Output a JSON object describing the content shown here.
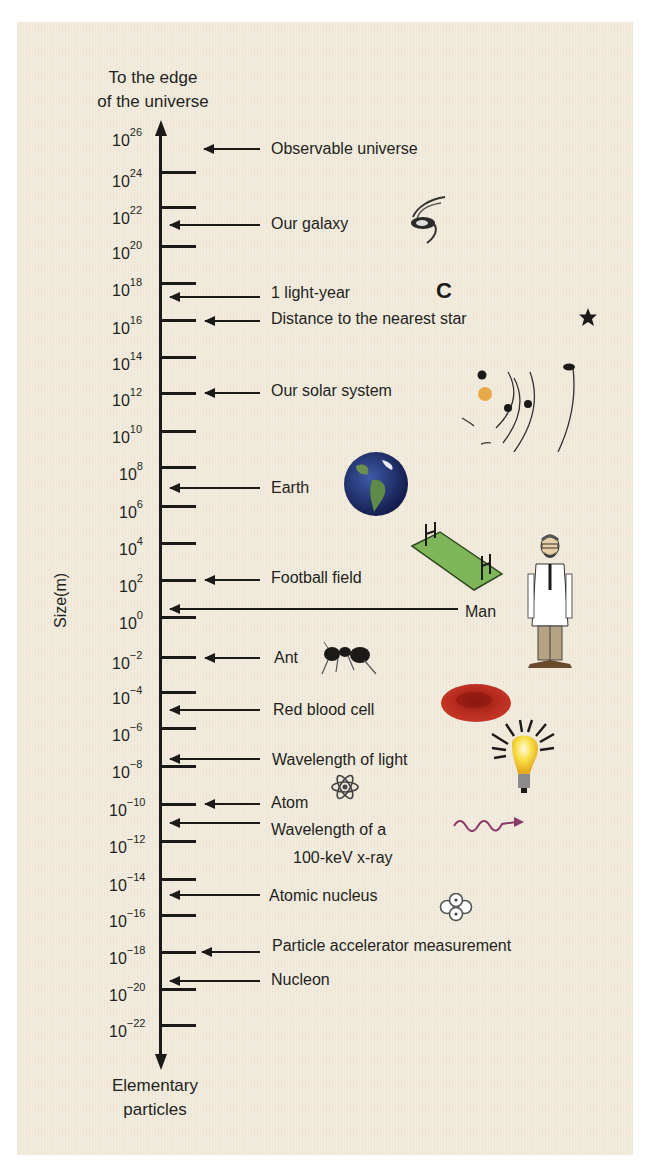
{
  "chart_data": {
    "type": "scale-diagram",
    "ylabel": "Size(m)",
    "top_label": "To the edge of the universe",
    "bottom_label": "Elementary particles",
    "ticks": [
      "10^26",
      "10^24",
      "10^22",
      "10^20",
      "10^18",
      "10^16",
      "10^14",
      "10^12",
      "10^10",
      "10^8",
      "10^6",
      "10^4",
      "10^2",
      "10^0",
      "10^-2",
      "10^-4",
      "10^-6",
      "10^-8",
      "10^-10",
      "10^-12",
      "10^-14",
      "10^-16",
      "10^-18",
      "10^-20",
      "10^-22"
    ],
    "items": [
      {
        "label": "Observable universe",
        "size_m": "1e26"
      },
      {
        "label": "Our galaxy",
        "size_m": "1e21"
      },
      {
        "label": "1 light-year",
        "size_m": "1e16 (~9.5e15)"
      },
      {
        "label": "Distance to the nearest star",
        "size_m": "1e16"
      },
      {
        "label": "Our solar system",
        "size_m": "1e12"
      },
      {
        "label": "Earth",
        "size_m": "1e7"
      },
      {
        "label": "Football field",
        "size_m": "1e2"
      },
      {
        "label": "Man",
        "size_m": "1e0"
      },
      {
        "label": "Ant",
        "size_m": "1e-2"
      },
      {
        "label": "Red blood cell",
        "size_m": "1e-5"
      },
      {
        "label": "Wavelength of light",
        "size_m": "1e-7"
      },
      {
        "label": "Atom",
        "size_m": "1e-10"
      },
      {
        "label": "Wavelength of a 100-keV x-ray",
        "size_m": "1e-11"
      },
      {
        "label": "Atomic nucleus",
        "size_m": "1e-15"
      },
      {
        "label": "Particle accelerator measurement",
        "size_m": "1e-18"
      },
      {
        "label": "Nucleon",
        "size_m": "1e-19"
      }
    ]
  },
  "diagram": {
    "top_label_1": "To the edge",
    "top_label_2": "of the universe",
    "bottom_label_1": "Elementary",
    "bottom_label_2": "particles",
    "axis_title": "Size(m)",
    "tick_exponents": [
      "26",
      "24",
      "22",
      "20",
      "18",
      "16",
      "14",
      "12",
      "10",
      "8",
      "6",
      "4",
      "2",
      "0",
      "−2",
      "−4",
      "−6",
      "−8",
      "−10",
      "−12",
      "−14",
      "−16",
      "−18",
      "−20",
      "−22"
    ],
    "tick_base": "10",
    "labels": {
      "observable": "Observable universe",
      "galaxy": "Our galaxy",
      "lightyear": "1 light-year",
      "nearest_star": "Distance to the nearest star",
      "solar": "Our solar system",
      "earth": "Earth",
      "football": "Football field",
      "man": "Man",
      "ant": "Ant",
      "rbc": "Red blood cell",
      "light": "Wavelength of light",
      "atom": "Atom",
      "xray_1": "Wavelength of a",
      "xray_2": "100-keV x-ray",
      "nucleus": "Atomic nucleus",
      "accelerator": "Particle accelerator measurement",
      "nucleon": "Nucleon"
    },
    "icons": [
      "galaxy-icon",
      "moon-crescent-icon",
      "star-icon",
      "solar-system-icon",
      "earth-icon",
      "football-field-icon",
      "man-icon",
      "ant-icon",
      "red-blood-cell-icon",
      "light-bulb-icon",
      "atom-icon",
      "wave-icon",
      "nucleus-icon"
    ],
    "colors": {
      "background": "#f2ebdc",
      "ink": "#1c1a18",
      "field": "#7fb659",
      "blood": "#b0261b",
      "bulb": "#f5d33a",
      "wave": "#8a3a6a",
      "sun": "#e8a94a"
    }
  }
}
